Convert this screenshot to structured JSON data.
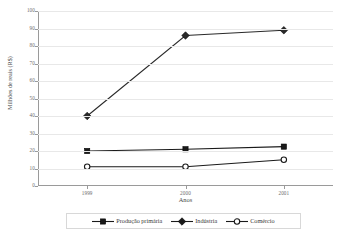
{
  "chart_data": {
    "type": "line",
    "title": "",
    "xlabel": "Anos",
    "ylabel": "Milhões de reais (R$)",
    "categories": [
      "1999",
      "2000",
      "2001"
    ],
    "x": [
      1999,
      2000,
      2001
    ],
    "ylim": [
      0,
      100
    ],
    "yticks": [
      0,
      10,
      20,
      30,
      40,
      50,
      60,
      70,
      80,
      90,
      100
    ],
    "ytick_labels": [
      "0",
      "10",
      "20",
      "30",
      "40",
      "50",
      "60",
      "70",
      "80",
      "90",
      "100"
    ],
    "grid": "horizontal",
    "legend_position": "bottom",
    "series": [
      {
        "name": "Produção primária",
        "marker": "filled-square",
        "color": "#1a1a1a",
        "values": [
          20,
          21,
          22.5
        ]
      },
      {
        "name": "Indústria",
        "marker": "filled-diamond",
        "color": "#2a2a2a",
        "values": [
          40,
          86,
          89
        ]
      },
      {
        "name": "Comércio",
        "marker": "open-circle",
        "color": "#1a1a1a",
        "values": [
          11,
          11,
          15
        ]
      }
    ]
  },
  "axis": {
    "x_title": "Anos",
    "y_title": "Milhões de reais (R$)"
  },
  "legend": {
    "items": [
      {
        "label": "Produção primária",
        "marker": "filled-square"
      },
      {
        "label": "Indústria",
        "marker": "filled-diamond"
      },
      {
        "label": "Comércio",
        "marker": "open-circle"
      }
    ]
  },
  "colors": {
    "line": "#2b2b2b",
    "grid": "#e8e8e8",
    "axis": "#9a9a9a",
    "text": "#4a4a4a",
    "tick_text": "#6b6b6b",
    "background": "#ffffff"
  }
}
